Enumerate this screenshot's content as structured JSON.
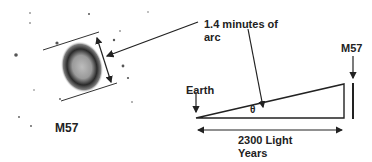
{
  "image": {
    "object_label": "M57"
  },
  "diagram": {
    "angle_label_line1": "1.4 minutes of",
    "angle_label_line2": "arc",
    "observer_label": "Earth",
    "target_label": "M57",
    "theta_symbol": "θ",
    "distance_line1": "2300 Light",
    "distance_line2": "Years"
  },
  "colors": {
    "ink": "#222222",
    "background": "#ffffff"
  }
}
